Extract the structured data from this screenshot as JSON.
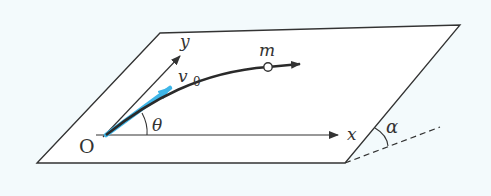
{
  "diagram": {
    "type": "inclined-plane-projectile",
    "labels": {
      "origin": "O",
      "x_axis": "x",
      "y_axis": "y",
      "initial_velocity": "v",
      "initial_velocity_subscript": "0",
      "mass": "m",
      "launch_angle": "θ",
      "incline_angle": "α"
    },
    "colors": {
      "background": "#f3fafc",
      "plane_fill": "#ffffff",
      "line": "#333333",
      "velocity_arrow": "#3fb6e8",
      "trajectory": "#2a2a2a"
    }
  }
}
